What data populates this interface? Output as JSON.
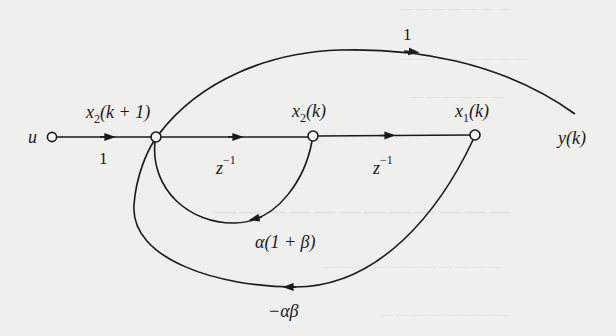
{
  "diagram": {
    "type": "signal-flow-graph",
    "nodes": [
      {
        "id": "u",
        "label": "u"
      },
      {
        "id": "x2_k1",
        "label_base": "x",
        "label_sub": "2",
        "label_rest": "(k + 1)"
      },
      {
        "id": "x2_k",
        "label_base": "x",
        "label_sub": "2",
        "label_rest": "(k)"
      },
      {
        "id": "x1_k",
        "label_base": "x",
        "label_sub": "1",
        "label_rest": "(k)"
      },
      {
        "id": "y_k",
        "label": "y(k)"
      }
    ],
    "branches": [
      {
        "from": "u",
        "to": "x2_k1",
        "gain": "1"
      },
      {
        "from": "x2_k1",
        "to": "x2_k",
        "gain_base": "z",
        "gain_sup": "−1"
      },
      {
        "from": "x2_k",
        "to": "x1_k",
        "gain_base": "z",
        "gain_sup": "−1"
      },
      {
        "from": "x2_k1",
        "to": "y_k",
        "gain": "1"
      },
      {
        "from": "x2_k",
        "to": "x2_k1",
        "gain": "α(1 + β)"
      },
      {
        "from": "x1_k",
        "to": "x2_k1",
        "gain": "−αβ"
      }
    ]
  },
  "colors": {
    "ink": "#1a1a1a",
    "paper": "#efefed",
    "bleed_through": "#d6d6d3"
  }
}
